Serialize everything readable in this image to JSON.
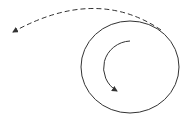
{
  "diagram": {
    "colors": {
      "background": "#ffffff",
      "stroke": "#333333"
    },
    "circle": {
      "cx": 130,
      "cy": 67,
      "rx": 49,
      "ry": 46
    },
    "inner_arrow": {
      "path": "M 130 41 A 28 27 0 0 0 117 91"
    },
    "dashed_arrow": {
      "path": "M 161 30 Q 96 -14 13 32",
      "dash": "5 3"
    }
  }
}
